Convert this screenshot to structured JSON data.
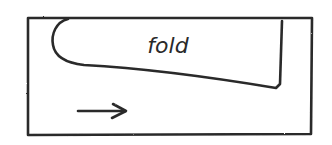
{
  "diagram": {
    "label": "fold",
    "arrow_direction": "right",
    "ink_color": "#2a2a2a",
    "background_color": "#ffffff"
  }
}
